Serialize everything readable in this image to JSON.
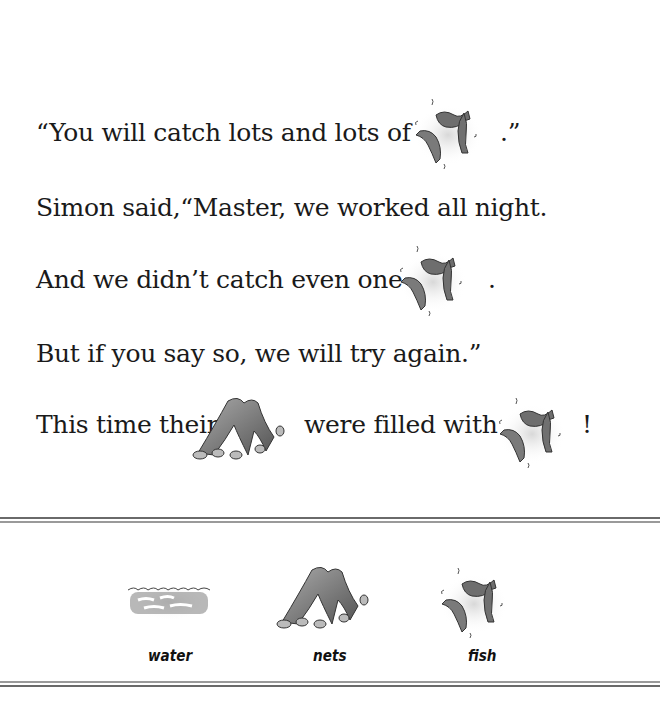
{
  "story": {
    "line1": {
      "before": "“You will catch lots and lots of",
      "after": ".”",
      "picture": "fish"
    },
    "line2": {
      "text": "Simon said,“Master, we worked all night."
    },
    "line3": {
      "before": "And we didn’t catch even one",
      "after": ".",
      "picture": "fish"
    },
    "line4": {
      "text": "But if you say so, we will try again.”"
    },
    "line5": {
      "before": "This time their",
      "middle": "were filled with",
      "after": "!",
      "pictures": [
        "nets",
        "fish"
      ]
    }
  },
  "legend": {
    "items": [
      {
        "icon": "water-icon",
        "label": "water"
      },
      {
        "icon": "nets-icon",
        "label": "nets"
      },
      {
        "icon": "fish-icon",
        "label": "fish"
      }
    ]
  },
  "colors": {
    "rule": "#6a6a6a",
    "text": "#1a1a1a",
    "illustration": "#777777"
  }
}
